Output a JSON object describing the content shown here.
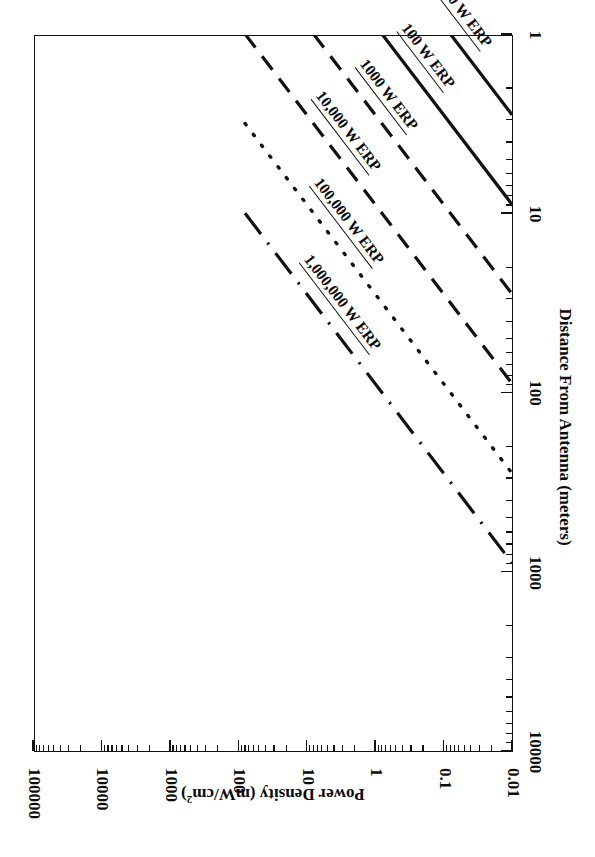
{
  "figure": {
    "rotation_degrees": 180,
    "background": "#ffffff",
    "ink": "#111111"
  },
  "axes": {
    "x": {
      "title": "Distance From Antenna (meters)",
      "scale": "log",
      "min": 1,
      "max": 10000,
      "tick_labels": [
        "1",
        "10",
        "100",
        "1000",
        "10000"
      ],
      "tick_values": [
        1,
        10,
        100,
        1000,
        10000
      ]
    },
    "y": {
      "title_main": "Power Density (mW/cm",
      "title_sup": "2",
      "title_tail": ")",
      "title": "Power Density (mW/cm2)",
      "scale": "log",
      "min": 0.01,
      "max": 100000,
      "tick_labels": [
        "100000",
        "10000",
        "1000",
        "100",
        "10",
        "1",
        "0.1",
        "0.01"
      ],
      "tick_values": [
        100000,
        10000,
        1000,
        100,
        10,
        1,
        0.1,
        0.01
      ]
    }
  },
  "chart_data": {
    "type": "line",
    "title": "",
    "subtitle": "",
    "xlabel": "Distance From Antenna (meters)",
    "ylabel": "Power Density (mW/cm2)",
    "xscale": "log",
    "yscale": "log",
    "xlim": [
      1,
      10000
    ],
    "ylim": [
      0.01,
      100000
    ],
    "grid": false,
    "legend": "inline-curve-labels",
    "annotation": "Free-space power density S = ERP / (4*pi*d^2); every line has slope -2 on log-log axes.",
    "series": [
      {
        "name": "10 W ERP",
        "label": "10 W ERP",
        "style": "solid",
        "erp_watts": 10,
        "x": [
          1,
          3.162,
          10,
          31.62,
          100,
          316.2
        ],
        "y": [
          79.6,
          7.96,
          0.796,
          0.0796,
          0.00796,
          0.000796
        ],
        "x_drawn": [
          1,
          177.8
        ],
        "y_drawn": [
          79.6,
          0.00252
        ]
      },
      {
        "name": "100 W ERP",
        "label": "100 W ERP",
        "style": "solid",
        "erp_watts": 100,
        "x": [
          1,
          3.162,
          10,
          31.62,
          100,
          316.2,
          1000
        ],
        "y": [
          796,
          79.6,
          7.96,
          0.796,
          0.0796,
          0.00796,
          0.000796
        ],
        "x_drawn": [
          1,
          562
        ],
        "y_drawn": [
          796,
          0.00252
        ]
      },
      {
        "name": "1000 W ERP",
        "label": "1000 W ERP",
        "style": "dashed",
        "erp_watts": 1000,
        "x": [
          1,
          3.162,
          10,
          31.62,
          100,
          316.2,
          1000
        ],
        "y": [
          7960,
          796,
          79.6,
          7.96,
          0.796,
          0.0796,
          0.00796
        ],
        "x_drawn": [
          1,
          1778
        ],
        "y_drawn": [
          7960,
          0.00252
        ]
      },
      {
        "name": "10,000 W ERP",
        "label": "10,000 W ERP",
        "style": "dashed",
        "erp_watts": 10000,
        "x": [
          1,
          10,
          100,
          1000,
          3162
        ],
        "y": [
          79600,
          796,
          7.96,
          0.0796,
          0.00796
        ],
        "x_drawn": [
          1,
          5620
        ],
        "y_drawn": [
          79600,
          0.00252
        ]
      },
      {
        "name": "100,000 W ERP",
        "label": "100,000 W ERP",
        "style": "dotted",
        "erp_watts": 100000,
        "x": [
          1,
          10,
          100,
          1000,
          10000
        ],
        "y": [
          796000,
          7960,
          79.6,
          0.796,
          0.00796
        ],
        "x_drawn": [
          3.16,
          10000
        ],
        "y_drawn": [
          79600,
          0.00796
        ]
      },
      {
        "name": "1,000,000 W ERP",
        "label": "1,000,000 W ERP",
        "style": "dash-dot",
        "erp_watts": 1000000,
        "x": [
          1,
          10,
          100,
          1000,
          10000
        ],
        "y": [
          7960000,
          79600,
          796,
          7.96,
          0.0796
        ],
        "x_drawn": [
          10,
          10000
        ],
        "y_drawn": [
          79600,
          0.0796
        ]
      }
    ]
  },
  "curve_labels": [
    {
      "text": "1,000,000 W ERP"
    },
    {
      "text": "100,000 W ERP"
    },
    {
      "text": "10,000 W ERP"
    },
    {
      "text": "1000 W ERP"
    },
    {
      "text": "100 W ERP"
    },
    {
      "text": "10 W ERP"
    }
  ]
}
